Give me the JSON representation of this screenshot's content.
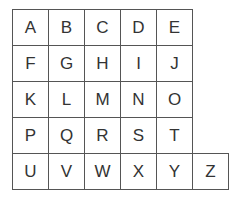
{
  "grid": {
    "rows": [
      [
        "A",
        "B",
        "C",
        "D",
        "E"
      ],
      [
        "F",
        "G",
        "H",
        "I",
        "J"
      ],
      [
        "K",
        "L",
        "M",
        "N",
        "O"
      ],
      [
        "P",
        "Q",
        "R",
        "S",
        "T"
      ],
      [
        "U",
        "V",
        "W",
        "X",
        "Y",
        "Z"
      ]
    ]
  }
}
